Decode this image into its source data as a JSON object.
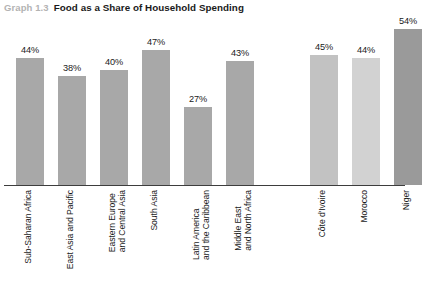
{
  "header": {
    "graph_number": "Graph 1.3",
    "title": "Food as a Share of Household Spending"
  },
  "chart_data": {
    "type": "bar",
    "title": "Food as a Share of Household Spending",
    "xlabel": "",
    "ylabel": "",
    "ylim": [
      0,
      60
    ],
    "grid": false,
    "legend": false,
    "unit": "%",
    "categories": [
      "Sub-Saharan Africa",
      "East Asia and Pacific",
      "Eastern Europe\nand Central Asia",
      "South Asia",
      "Latin America\nand the Caribbean",
      "Middle East\nand North Africa",
      "Côte d'Ivoire",
      "Morocco",
      "Niger"
    ],
    "values": [
      44,
      38,
      40,
      47,
      27,
      43,
      45,
      44,
      54
    ],
    "value_labels": [
      "44%",
      "38%",
      "40%",
      "47%",
      "27%",
      "43%",
      "45%",
      "44%",
      "54%"
    ],
    "groups": [
      {
        "name": "regions",
        "categories": [
          "Sub-Saharan Africa",
          "East Asia and Pacific",
          "Eastern Europe and Central Asia",
          "South Asia",
          "Latin America and the Caribbean",
          "Middle East and North Africa"
        ]
      },
      {
        "name": "countries",
        "categories": [
          "Côte d'Ivoire",
          "Morocco",
          "Niger"
        ]
      }
    ],
    "bar_colors": [
      "#a8a8a8",
      "#a8a8a8",
      "#a8a8a8",
      "#a8a8a8",
      "#a8a8a8",
      "#a8a8a8",
      "#c2c2c2",
      "#d2d2d2",
      "#9a9a9a"
    ]
  },
  "colors": {
    "axis": "#3d3d3d",
    "graph_number": "#b3b3b3",
    "title": "#1a1a1a",
    "background": "#ffffff"
  }
}
